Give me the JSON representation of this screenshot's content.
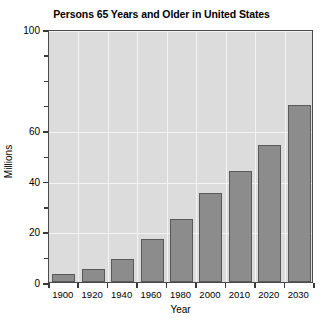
{
  "chart_data": {
    "type": "bar",
    "title": "Persons 65 Years and Older in United States",
    "xlabel": "Year",
    "ylabel": "Millions",
    "categories": [
      "1900",
      "1920",
      "1940",
      "1960",
      "1980",
      "2000",
      "2010",
      "2020",
      "2030"
    ],
    "values": [
      3,
      5,
      9,
      17,
      25,
      35,
      44,
      54,
      70
    ],
    "ylim": [
      0,
      100
    ],
    "ytick_labels": [
      "0",
      "20",
      "40",
      "60",
      "100"
    ],
    "ytick_values": [
      0,
      20,
      40,
      60,
      100
    ],
    "yminor_tick_values": [
      10,
      30,
      50,
      70,
      80,
      90
    ],
    "grid": true,
    "legend": "none",
    "colors": {
      "bar_fill": "#8c8c8c",
      "bar_border": "#595959",
      "plot_background": "#dcdcdc",
      "gridline": "#f4f4f4",
      "frame": "#4a4a4a",
      "text": "#000000",
      "page_background": "#ffffff"
    }
  }
}
